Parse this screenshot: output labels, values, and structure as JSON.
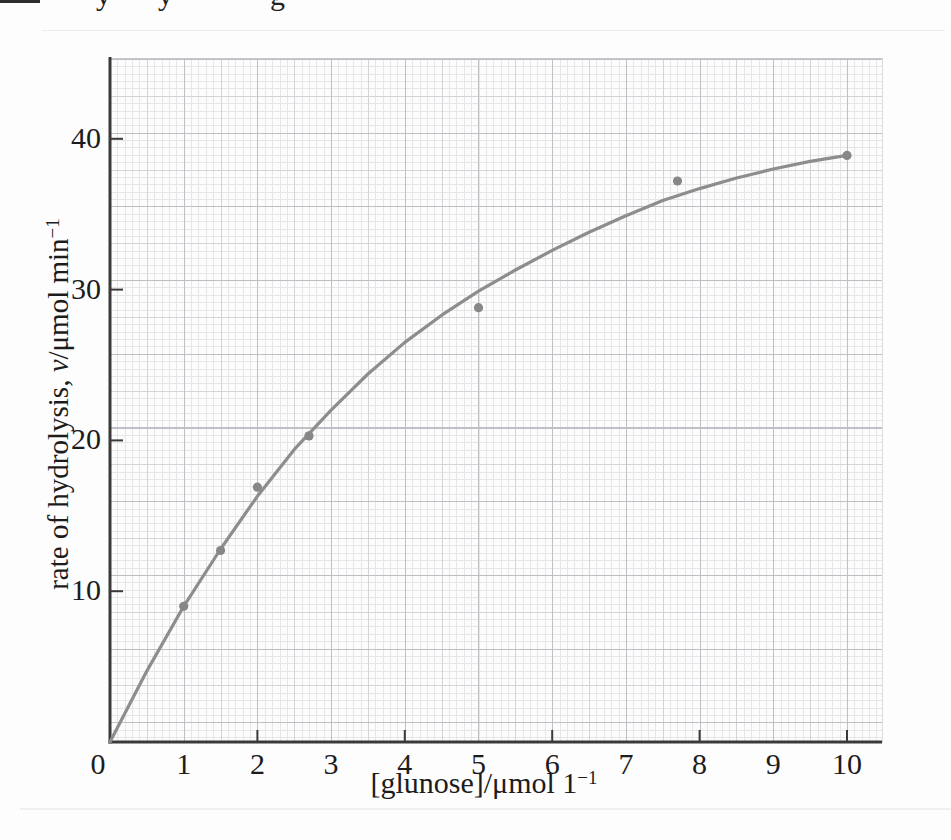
{
  "figure": {
    "kind": "scanned book figure",
    "top_fragments": {
      "note": "descenders of a cropped line of text above the figure",
      "letters": [
        "y",
        "y",
        "g"
      ]
    }
  },
  "labels": {
    "y_title_pre": "rate of hydrolysis, ",
    "y_title_var": "v",
    "y_title_post": "/μmol min",
    "y_title_sup": "−1",
    "x_title_pre": "[glunose]/μmol 1",
    "x_title_sup": "−1"
  },
  "colors": {
    "curve": "#8d8d8d",
    "point": "#878787",
    "axis": "#3a3a3a",
    "grid_minor": "#e6e6e9",
    "grid_medium": "#d3d3d8",
    "grid_major": "#bfbfc6",
    "text": "#1c1c1c",
    "background": "#fdfdfe"
  },
  "chart_data": {
    "type": "scatter",
    "title": "",
    "xlabel": "[glunose]/μmol 1−1",
    "ylabel": "rate of hydrolysis, v/μmol min−1",
    "xlim": [
      0,
      10.47
    ],
    "ylim": [
      0,
      45.4
    ],
    "grid": "fine graph paper (minor, medium every 5, major every 10 squares)",
    "legend": "none",
    "x_tick_labels": [
      0,
      1,
      2,
      3,
      4,
      5,
      6,
      7,
      8,
      9,
      10
    ],
    "x_tick_marks": [
      2,
      4,
      6,
      8,
      10
    ],
    "y_ticks": [
      10,
      20,
      30,
      40
    ],
    "points": [
      [
        1,
        9.0
      ],
      [
        1.5,
        12.7
      ],
      [
        2,
        16.9
      ],
      [
        2.7,
        20.3
      ],
      [
        5,
        28.8
      ],
      [
        7.7,
        37.2
      ],
      [
        10,
        38.9
      ]
    ],
    "curve": [
      [
        0,
        0
      ],
      [
        0.5,
        4.7
      ],
      [
        1,
        9.0
      ],
      [
        1.5,
        12.8
      ],
      [
        2,
        16.3
      ],
      [
        2.5,
        19.4
      ],
      [
        3,
        22.0
      ],
      [
        3.5,
        24.4
      ],
      [
        4,
        26.5
      ],
      [
        4.5,
        28.3
      ],
      [
        5,
        29.9
      ],
      [
        5.5,
        31.3
      ],
      [
        6,
        32.6
      ],
      [
        6.5,
        33.8
      ],
      [
        7,
        34.9
      ],
      [
        7.5,
        35.9
      ],
      [
        8,
        36.7
      ],
      [
        8.5,
        37.4
      ],
      [
        9,
        38.0
      ],
      [
        9.5,
        38.5
      ],
      [
        10,
        38.9
      ]
    ]
  }
}
